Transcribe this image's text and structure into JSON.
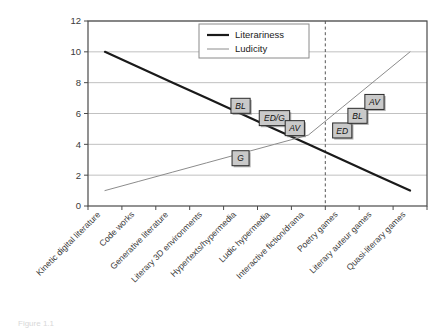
{
  "chart_data": {
    "type": "line",
    "title": "",
    "xlabel": "",
    "ylabel": "",
    "ylim": [
      0,
      12
    ],
    "yticks": [
      0,
      2,
      4,
      6,
      8,
      10,
      12
    ],
    "grid": true,
    "legend_position": "top-center",
    "categories": [
      "Kinetic digital literature",
      "Code works",
      "Generative literature",
      "Literary 3D environments",
      "Hypertexts/hypermedia",
      "Ludic hypermedia",
      "Interactive fiction/drama",
      "Poetry games",
      "Literary auteur games",
      "Quasi-literary games"
    ],
    "series": [
      {
        "name": "Literariness",
        "color": "#1a1a1a",
        "width": 2.2,
        "values": [
          10,
          9,
          8,
          7,
          6,
          5,
          4,
          3,
          2,
          1
        ]
      },
      {
        "name": "Ludicity",
        "color": "#8c8c8c",
        "width": 1.0,
        "values": [
          1,
          1.6,
          2.2,
          2.8,
          3.4,
          4,
          4.6,
          6.4,
          8.2,
          10
        ]
      }
    ],
    "divider": {
      "label": "category-divider",
      "after_category_index": 6,
      "style": "dashed",
      "color": "#555555"
    },
    "annotations": [
      {
        "label": "BL",
        "category_index": 4,
        "value": 6.5,
        "series": "Literariness"
      },
      {
        "label": "ED/G",
        "category_index": 5,
        "value": 5.7,
        "series": "Literariness"
      },
      {
        "label": "AV",
        "category_index": 5.6,
        "value": 5.05,
        "series": "Literariness"
      },
      {
        "label": "G",
        "category_index": 4,
        "value": 3.1,
        "series": "Ludicity"
      },
      {
        "label": "ED",
        "category_index": 7,
        "value": 4.9,
        "series": "Ludicity"
      },
      {
        "label": "BL",
        "category_index": 7.45,
        "value": 5.85,
        "series": "Ludicity"
      },
      {
        "label": "AV",
        "category_index": 7.95,
        "value": 6.75,
        "series": "Ludicity"
      }
    ],
    "annotation_style": {
      "fill": "#c9c9c9",
      "stroke": "#2a2a2a",
      "text_style": "italic"
    }
  },
  "legend": {
    "items": [
      {
        "label": "Literariness",
        "swatch": "thick-dark-line"
      },
      {
        "label": "Ludicity",
        "swatch": "thin-gray-line"
      }
    ]
  },
  "caption": {
    "text": "Figure 1.1"
  }
}
